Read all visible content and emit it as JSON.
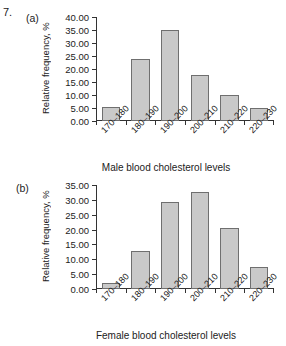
{
  "question_number": "7.",
  "figures": [
    {
      "panel_label": "(a)",
      "ytitle": "Relative frequency, %",
      "xtitle": "Male blood cholesterol levels"
    },
    {
      "panel_label": "(b)",
      "ytitle": "Relative frequency, %",
      "xtitle": "Female blood cholesterol levels"
    }
  ],
  "chart_data": [
    {
      "type": "bar",
      "title": "",
      "panel": "(a)",
      "categories": [
        "170–180",
        "180–190",
        "190–200",
        "200–210",
        "210–220",
        "220–230"
      ],
      "values": [
        5.5,
        23.7,
        35.0,
        17.7,
        10.0,
        4.9
      ],
      "xlabel": "Male blood cholesterol levels",
      "ylabel": "Relative frequency, %",
      "ylim": [
        0,
        40
      ],
      "ytick_step": 5,
      "ytick_labels": [
        "0.00",
        "5.00",
        "10.00",
        "15.00",
        "20.00",
        "25.00",
        "30.00",
        "35.00",
        "40.00"
      ],
      "grid": false,
      "legend": false,
      "bar_fill": "#c9c9c9",
      "bar_edge": "#6f6f6f"
    },
    {
      "type": "bar",
      "title": "",
      "panel": "(b)",
      "categories": [
        "170–180",
        "180–190",
        "190–200",
        "200–210",
        "210–220",
        "220–230"
      ],
      "values": [
        2.0,
        12.8,
        29.2,
        32.5,
        20.7,
        7.4
      ],
      "xlabel": "Female blood cholesterol levels",
      "ylabel": "Relative frequency, %",
      "ylim": [
        0,
        35
      ],
      "ytick_step": 5,
      "ytick_labels": [
        "0.00",
        "5.00",
        "10.00",
        "15.00",
        "20.00",
        "25.00",
        "30.00",
        "35.00"
      ],
      "grid": false,
      "legend": false,
      "bar_fill": "#c9c9c9",
      "bar_edge": "#6f6f6f"
    }
  ]
}
